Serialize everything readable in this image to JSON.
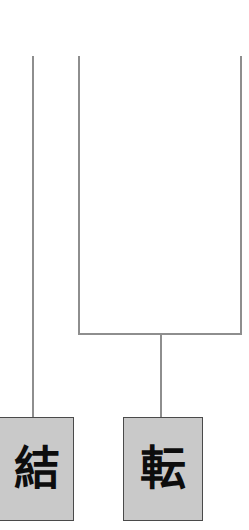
{
  "canvas": {
    "width": 249,
    "height": 530,
    "background": "#ffffff"
  },
  "diagram": {
    "type": "syntactic-tree-fragment",
    "line_color": "#8e8e8e",
    "node_fill": "#c9c9c9",
    "node_border": "#4a4a4a",
    "node_text_color": "#0d0d0d"
  },
  "edges": [
    {
      "name": "branch-left-long",
      "orientation": "vertical",
      "x": 32,
      "y": 56,
      "length": 362
    },
    {
      "name": "branch-middle-upper",
      "orientation": "vertical",
      "x": 78,
      "y": 56,
      "length": 278
    },
    {
      "name": "branch-right-upper",
      "orientation": "vertical",
      "x": 240,
      "y": 56,
      "length": 278
    },
    {
      "name": "connector-horizontal",
      "orientation": "horizontal",
      "x": 78,
      "y": 333,
      "length": 164
    },
    {
      "name": "branch-stem-down",
      "orientation": "vertical",
      "x": 160,
      "y": 333,
      "length": 85
    }
  ],
  "nodes": [
    {
      "name": "terminal-node-ketsu",
      "label": "結",
      "x": -8,
      "y": 417,
      "width": 82,
      "height": 104,
      "clipped": "left"
    },
    {
      "name": "terminal-node-ten",
      "label": "転",
      "x": 123,
      "y": 417,
      "width": 80,
      "height": 104,
      "clipped": "none"
    }
  ]
}
